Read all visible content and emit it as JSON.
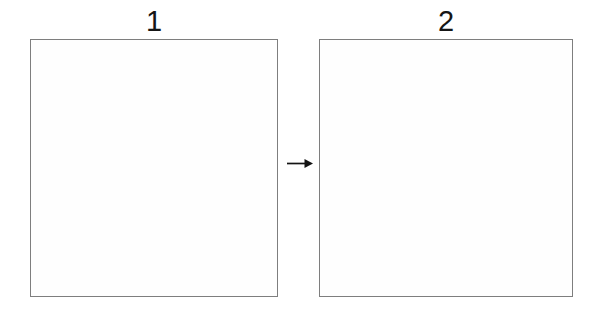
{
  "figure": {
    "panels": [
      {
        "label": "1"
      },
      {
        "label": "2"
      }
    ],
    "arrow": {
      "name": "right-arrow",
      "direction": "right"
    },
    "colors": {
      "background": "#ffffff",
      "box_border": "#7e7e7e",
      "box_fill": "#fefefe",
      "label_text": "#161616",
      "arrow": "#141414"
    }
  }
}
